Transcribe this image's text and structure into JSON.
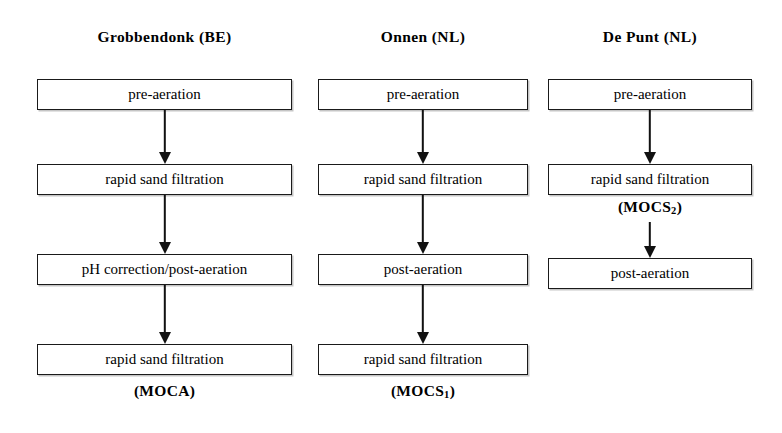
{
  "diagram": {
    "title_type": "water-treatment-process-flow",
    "columns": [
      {
        "header": "Grobbendonk (BE)",
        "steps": [
          "pre-aeration",
          "rapid sand filtration",
          "pH correction/post-aeration",
          "rapid sand filtration"
        ],
        "code_label": "(MOCA)",
        "code_label_base": "(MOCA)",
        "code_label_sub": "",
        "code_label_position": "bottom"
      },
      {
        "header": "Onnen (NL)",
        "steps": [
          "pre-aeration",
          "rapid sand filtration",
          "post-aeration",
          "rapid sand filtration"
        ],
        "code_label": "(MOCS1)",
        "code_label_base": "(MOCS",
        "code_label_sub": "1",
        "code_label_suffix": ")",
        "code_label_position": "bottom"
      },
      {
        "header": "De Punt (NL)",
        "steps": [
          "pre-aeration",
          "rapid sand filtration",
          "post-aeration"
        ],
        "code_label": "(MOCS2)",
        "code_label_base": "(MOCS",
        "code_label_sub": "2",
        "code_label_suffix": ")",
        "code_label_position": "after-step-2"
      }
    ],
    "colors": {
      "box_border": "#1a1a1a",
      "box_fill": "#ffffff",
      "arrow": "#111111",
      "text": "#000000",
      "background": "#ffffff"
    }
  }
}
